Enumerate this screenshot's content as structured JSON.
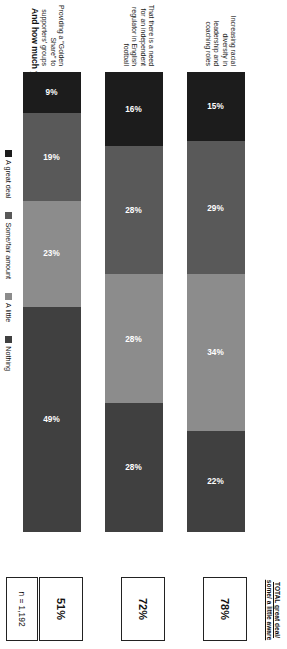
{
  "title": "And how much you have seen, heard or read about each of following issues related to English football?",
  "total_header": "TOTAL  great deal/ some/ a little aware",
  "sample_note": "n = 1,192",
  "colors": {
    "a_great_deal": "#1c1c1c",
    "some_fair_amount": "#595959",
    "a_little": "#8c8c8c",
    "nothing": "#404040"
  },
  "legend": [
    {
      "label": "A great deal",
      "color": "#1c1c1c"
    },
    {
      "label": "Some/fair amount",
      "color": "#595959"
    },
    {
      "label": "A little",
      "color": "#8c8c8c"
    },
    {
      "label": "Nothing",
      "color": "#404040"
    }
  ],
  "rows": [
    {
      "category": "Increasing racial diversity in leadership and coaching roles",
      "total": "78%",
      "segments": [
        {
          "series": "A great deal",
          "value": 15,
          "label": "15%"
        },
        {
          "series": "Some/fair amount",
          "value": 29,
          "label": "29%"
        },
        {
          "series": "A little",
          "value": 34,
          "label": "34%"
        },
        {
          "series": "Nothing",
          "value": 22,
          "label": "22%"
        }
      ]
    },
    {
      "category": "That there is a need for an independent regulator in English football",
      "total": "72%",
      "segments": [
        {
          "series": "A great deal",
          "value": 16,
          "label": "16%"
        },
        {
          "series": "Some/fair amount",
          "value": 28,
          "label": "28%"
        },
        {
          "series": "A little",
          "value": 28,
          "label": "28%"
        },
        {
          "series": "Nothing",
          "value": 28,
          "label": "28%"
        }
      ]
    },
    {
      "category": "Providing a \"Golden Share\" to supporters' groups",
      "total": "51%",
      "segments": [
        {
          "series": "A great deal",
          "value": 9,
          "label": "9%"
        },
        {
          "series": "Some/fair amount",
          "value": 19,
          "label": "19%"
        },
        {
          "series": "A little",
          "value": 23,
          "label": "23%"
        },
        {
          "series": "Nothing",
          "value": 49,
          "label": "49%"
        }
      ]
    }
  ],
  "chart_data": {
    "type": "bar",
    "orientation": "horizontal-stacked",
    "title": "And how much you have seen, heard or read about each of following issues related to English football?",
    "xlabel": "",
    "ylabel": "",
    "xlim": [
      0,
      100
    ],
    "grid": false,
    "legend_position": "bottom",
    "categories": [
      "Increasing racial diversity in leadership and coaching roles",
      "That there is a need for an independent regulator in English football",
      "Providing a \"Golden Share\" to supporters' groups"
    ],
    "series": [
      {
        "name": "A great deal",
        "values": [
          15,
          16,
          9
        ]
      },
      {
        "name": "Some/fair amount",
        "values": [
          29,
          28,
          19
        ]
      },
      {
        "name": "A little",
        "values": [
          34,
          28,
          23
        ]
      },
      {
        "name": "Nothing",
        "values": [
          22,
          28,
          49
        ]
      }
    ],
    "annotations": {
      "totals_label": "TOTAL  great deal/ some/ a little aware",
      "totals": [
        "78%",
        "72%",
        "51%"
      ],
      "sample_size": "n = 1,192"
    }
  }
}
